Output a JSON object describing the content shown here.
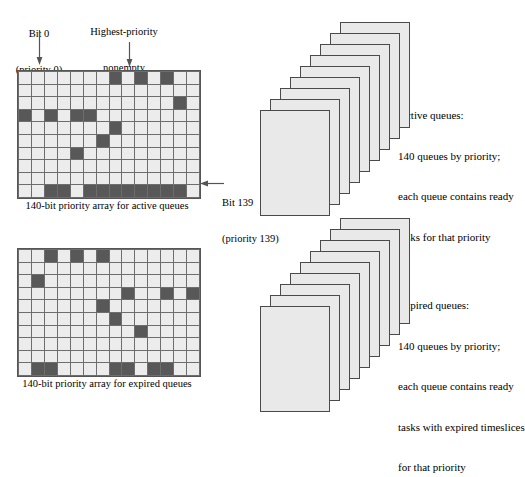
{
  "labels": {
    "bit0": {
      "line1": "Bit 0",
      "line2": "(priority 0)"
    },
    "highest_priority": {
      "line1": "Highest-priority",
      "line2": "nonempty",
      "line3": "active queue"
    },
    "bit139": {
      "line1": "Bit 139",
      "line2": "(priority 139)"
    }
  },
  "captions": {
    "active_array": "140-bit priority array for active queues",
    "expired_array": "140-bit priority array for expired queues"
  },
  "notes": {
    "active": {
      "line1": "Active queues:",
      "line2": "140 queues by priority;",
      "line3": "each queue contains ready",
      "line4": "tasks for that priority"
    },
    "expired": {
      "line1": "Expired queues:",
      "line2": "140 queues by priority;",
      "line3": "each queue contains ready",
      "line4": "tasks with expired timeslices",
      "line5": "for that priority"
    }
  },
  "colors": {
    "cell_on": "#585858",
    "cell_off": "#ececec",
    "grid_line": "#6d6d6d",
    "card_fill": "#e9e9e9",
    "card_border": "#4a4a4a",
    "arrow": "#555555"
  },
  "grids": {
    "columns": 14,
    "rows": 10,
    "active": {
      "name": "active-priority-array",
      "cells": [
        [
          0,
          0,
          0,
          0,
          0,
          0,
          0,
          1,
          0,
          1,
          0,
          1,
          0,
          0
        ],
        [
          0,
          0,
          0,
          0,
          0,
          0,
          0,
          0,
          0,
          0,
          0,
          0,
          0,
          0
        ],
        [
          0,
          0,
          0,
          0,
          0,
          0,
          0,
          0,
          0,
          0,
          0,
          0,
          1,
          0
        ],
        [
          1,
          0,
          1,
          0,
          1,
          1,
          0,
          0,
          0,
          0,
          0,
          0,
          0,
          0
        ],
        [
          0,
          0,
          0,
          0,
          0,
          0,
          0,
          1,
          0,
          0,
          0,
          0,
          0,
          0
        ],
        [
          0,
          0,
          0,
          0,
          0,
          0,
          1,
          0,
          0,
          0,
          0,
          0,
          0,
          0
        ],
        [
          0,
          0,
          0,
          0,
          1,
          0,
          0,
          0,
          0,
          0,
          0,
          0,
          0,
          0
        ],
        [
          0,
          0,
          0,
          0,
          0,
          0,
          0,
          0,
          0,
          0,
          0,
          0,
          0,
          0
        ],
        [
          0,
          0,
          0,
          0,
          0,
          0,
          0,
          0,
          0,
          0,
          0,
          0,
          0,
          0
        ],
        [
          0,
          0,
          1,
          1,
          0,
          1,
          1,
          1,
          1,
          1,
          1,
          1,
          1,
          0
        ]
      ]
    },
    "expired": {
      "name": "expired-priority-array",
      "cells": [
        [
          0,
          0,
          1,
          0,
          1,
          0,
          1,
          0,
          0,
          0,
          0,
          0,
          0,
          0
        ],
        [
          0,
          0,
          0,
          0,
          0,
          0,
          0,
          0,
          0,
          0,
          0,
          0,
          0,
          0
        ],
        [
          0,
          1,
          0,
          0,
          0,
          0,
          0,
          0,
          0,
          0,
          0,
          0,
          0,
          0
        ],
        [
          0,
          0,
          0,
          0,
          0,
          0,
          0,
          0,
          1,
          0,
          0,
          1,
          0,
          1
        ],
        [
          0,
          0,
          0,
          0,
          0,
          0,
          1,
          0,
          0,
          0,
          0,
          0,
          0,
          0
        ],
        [
          0,
          0,
          0,
          0,
          0,
          0,
          0,
          1,
          0,
          0,
          0,
          0,
          0,
          0
        ],
        [
          0,
          0,
          0,
          0,
          0,
          0,
          0,
          0,
          0,
          1,
          0,
          0,
          0,
          0
        ],
        [
          0,
          0,
          0,
          0,
          0,
          0,
          0,
          0,
          0,
          0,
          0,
          0,
          0,
          0
        ],
        [
          0,
          0,
          0,
          0,
          0,
          0,
          0,
          0,
          0,
          0,
          0,
          0,
          0,
          0
        ],
        [
          0,
          1,
          1,
          0,
          0,
          0,
          0,
          1,
          1,
          0,
          1,
          1,
          0,
          0
        ]
      ]
    }
  },
  "stacks": {
    "card_count": 9,
    "active": {
      "name": "active-queue-stack"
    },
    "expired": {
      "name": "expired-queue-stack"
    }
  }
}
